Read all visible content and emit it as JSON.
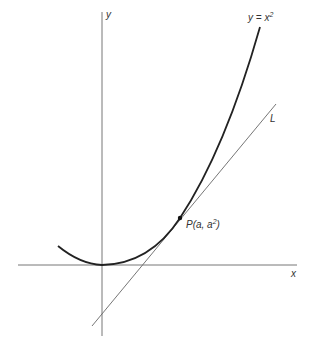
{
  "labels": {
    "y_axis": "y",
    "x_axis": "x",
    "curve_lhs": "y = x",
    "curve_exp": "2",
    "line": "L",
    "point_pre": "P(a, a",
    "point_exp": "2",
    "point_post": ")"
  },
  "colors": {
    "axis": "#777777",
    "curve": "#222222",
    "tangent": "#666666"
  }
}
